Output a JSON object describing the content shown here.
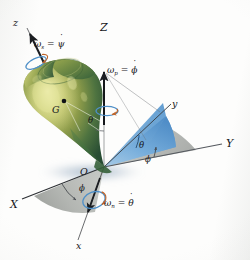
{
  "figure": {
    "background_color": "#fdfdfc"
  },
  "axes": {
    "fixed": [
      {
        "name": "axis-Z",
        "label": "Z",
        "color": "#8f6fc4",
        "description": "fixed vertical axis"
      },
      {
        "name": "axis-Y",
        "label": "Y",
        "color": "#5a5f66",
        "description": "fixed horizontal axis to the right"
      },
      {
        "name": "axis-X",
        "label": "X",
        "color": "#3a3d42",
        "description": "fixed axis to lower left"
      }
    ],
    "rotating": [
      {
        "name": "axis-z",
        "label": "z",
        "color": "#24262b",
        "description": "spin axis of the top, upper left"
      },
      {
        "name": "axis-y",
        "label": "y",
        "color": "#3a3d42",
        "description": "rotating axis upper right"
      },
      {
        "name": "axis-x",
        "label": "x",
        "color": "#24262b",
        "description": "rotating line of nodes, lower right"
      }
    ]
  },
  "body": {
    "name": "spinning-top",
    "center_of_gravity_label": "G",
    "origin_label": "O",
    "fill_colors": [
      "#8f9c3f",
      "#5d7c42",
      "#2f5537",
      "#c9cf7a"
    ],
    "shadow_color": "#9fb0c4"
  },
  "angular_velocities": [
    {
      "name": "spin",
      "symbol": "ω",
      "subscript": "s",
      "equals": "=",
      "rate": "ψ",
      "full": "ωs = ψ̇",
      "description": "spin about the z axis"
    },
    {
      "name": "precession",
      "symbol": "ω",
      "subscript": "p",
      "equals": "=",
      "rate": "ϕ",
      "full": "ωp = ϕ̇",
      "description": "precession about the Z axis"
    },
    {
      "name": "nutation",
      "symbol": "ω",
      "subscript": "n",
      "equals": "=",
      "rate": "θ",
      "full": "ωn = θ̇",
      "description": "nutation about the x axis (line of nodes)"
    }
  ],
  "angles": [
    {
      "name": "theta-at-body",
      "label": "θ",
      "description": "nutation angle between Z axis and z axis, marked near the top body"
    },
    {
      "name": "theta-wedge",
      "label": "θ",
      "description": "nutation angle in the blue wedge between y axis and horizontal"
    },
    {
      "name": "phi-wedge",
      "label": "ϕ",
      "description": "precession angle in the gray sector between Y axis and the wedge"
    },
    {
      "name": "phi-lower",
      "label": "ϕ",
      "description": "precession angle in the lower gray sector between X axis and x axis"
    }
  ],
  "planes": [
    {
      "name": "blue-wedge",
      "color": "#6ea6d6",
      "description": "tilted blue plane containing the z and y axes"
    },
    {
      "name": "gray-sector-upper",
      "color": "#b9bcba",
      "description": "horizontal gray sector between Y and the node line"
    },
    {
      "name": "gray-sector-lower",
      "color": "#b9bcba",
      "description": "horizontal gray sector between X and the x axis"
    }
  ]
}
